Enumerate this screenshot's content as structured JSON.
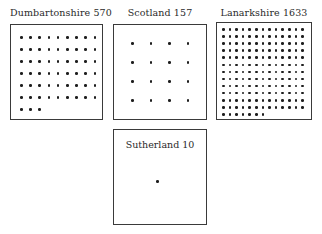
{
  "figure": {
    "panels": [
      {
        "name": "Dumbartonshire",
        "value": "570",
        "label": "Dumbartonshire 570",
        "dot_count": 57,
        "columns": 9
      },
      {
        "name": "Scotland",
        "value": "157",
        "label": "Scotland 157",
        "dot_count": 16,
        "columns": 4
      },
      {
        "name": "Lanarkshire",
        "value": "1633",
        "label": "Lanarkshire 1633",
        "dot_count": 163,
        "columns": 13
      },
      {
        "name": "Sutherland",
        "value": "10",
        "label": "Sutherland 10",
        "dot_count": 1,
        "columns": 1
      }
    ]
  }
}
